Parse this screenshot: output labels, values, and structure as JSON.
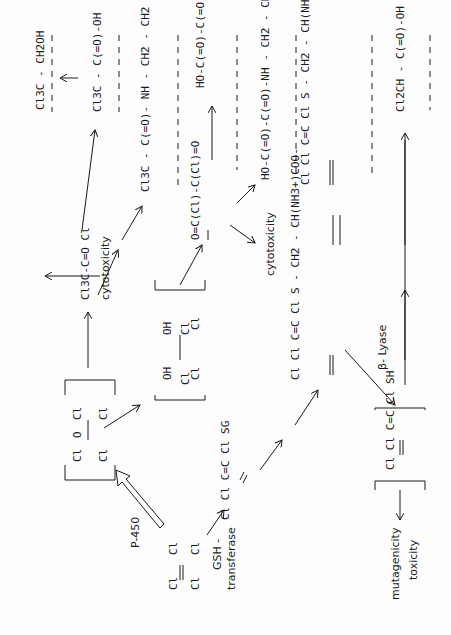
{
  "orientation": "rotated 90 degrees counter-clockwise",
  "compounds": [
    {
      "id": "pce",
      "text": "Cl2C=CCl2",
      "x": 143,
      "y": 600
    },
    {
      "id": "epoxide",
      "text": "[ Cl2C(O)CCl2 ]",
      "x": 95,
      "y": 430
    },
    {
      "id": "diol",
      "text": "[ Cl2C(OH)-C(OH)Cl2 ]",
      "x": 180,
      "y": 375
    },
    {
      "id": "tcac",
      "text": "Cl3C-C(=O)Cl",
      "x": 100,
      "y": 290
    },
    {
      "id": "tce_oh",
      "text": "Cl3C-CH2OH",
      "x": 45,
      "y": 110
    },
    {
      "id": "tca",
      "text": "Cl3C-C(=O)OH",
      "x": 100,
      "y": 110
    },
    {
      "id": "tca_amide",
      "text": "Cl3C-C(=O)NH-CH2-CH2-OH",
      "x": 148,
      "y": 190
    },
    {
      "id": "oxalyl",
      "text": "ClC(=O)C(=O)Cl",
      "x": 210,
      "y": 230
    },
    {
      "id": "oxalic",
      "text": "HO-C(=O)C(=O)-OH",
      "x": 200,
      "y": 80
    },
    {
      "id": "oxamide",
      "text": "HO-C(=O)C(=O)NH-CH2-CH2-OH",
      "x": 282,
      "y": 180
    },
    {
      "id": "gsh_conj",
      "text": "Cl2C=C(Cl)SG",
      "x": 225,
      "y": 505
    },
    {
      "id": "cys_conj",
      "text": "Cl2C=C(Cl)S-CH2-CH(NH3+)COO-",
      "x": 318,
      "y": 380
    },
    {
      "id": "nac_conj",
      "text": "Cl2C=C(Cl)S-CH2-CH(NHCOCH3)COOH",
      "x": 318,
      "y": 180
    },
    {
      "id": "thiol",
      "text": "[ Cl2C=C(Cl)SH ]",
      "x": 380,
      "y": 440
    },
    {
      "id": "dca",
      "text": "Cl2CH-C(=O)OH",
      "x": 410,
      "y": 110
    }
  ],
  "labels": {
    "p450": "P-450",
    "gsh_transferase_1": "GSH -",
    "gsh_transferase_2": "transferase",
    "beta_lyase": "β- Lyase",
    "cytotoxicity_1": "cytotoxicity",
    "cytotoxicity_2": "cytotoxicity",
    "mutagenicity": "mutagenicity",
    "toxicity": "toxicity",
    "equilibrium": "⇌"
  },
  "text": {
    "pce_cl1": "Cl",
    "pce_cl2": "Cl",
    "pce_cl3": "Cl",
    "pce_cl4": "Cl",
    "epox_cl1": "Cl",
    "epox_cl2": "Cl",
    "epox_o": "O",
    "epox_cl3": "Cl",
    "epox_cl4": "Cl",
    "diol_cl1": "Cl",
    "diol_oh1": "OH",
    "diol_cl2": "Cl",
    "diol_oh2": "OH",
    "diol_cl3": "Cl",
    "diol_cl4": "Cl",
    "tcac": "Cl3C-C=O  Cl",
    "tce_oh": "Cl3C - CH2OH",
    "tca": "Cl3C - C(=O)-OH",
    "tca_amide": "Cl3C - C(=O)- NH - CH2 - CH2 - OH",
    "oxalyl": "O=C(Cl)-C(Cl)=O",
    "oxalic": "HO-C(=O)-C(=O)-OH",
    "oxamide": "HO-C(=O)-C(=O)-NH - CH2 - CH2 - OH",
    "gsh_conj": "Cl Cl C=C Cl SG",
    "cys_conj": "Cl Cl C=C Cl S - CH2 - CH(NH3+)COO-",
    "nac_conj": "Cl Cl C=C Cl S - CH2 - CH(NHCOCH3)COOH",
    "thiol": "Cl Cl C=C Cl SH",
    "dca": "Cl2CH - C(=O)-OH"
  }
}
